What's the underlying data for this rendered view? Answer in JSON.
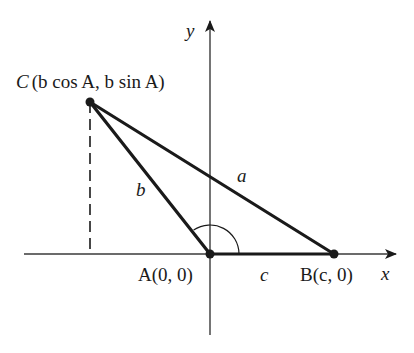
{
  "diagram": {
    "type": "triangle-coordinate-diagram",
    "colors": {
      "line": "#1a1a1a",
      "axis": "#3a3a3a",
      "background": "#ffffff"
    },
    "axes": {
      "x_label": "x",
      "y_label": "y"
    },
    "points": {
      "A": {
        "label": "A(0, 0)",
        "px": [
          210,
          254
        ]
      },
      "B": {
        "label": "B(c, 0)",
        "px": [
          334,
          254
        ]
      },
      "C": {
        "label": "C(b cos A, b sin A)",
        "px": [
          90,
          102
        ]
      }
    },
    "sides": {
      "a": "a",
      "b": "b",
      "c": "c"
    },
    "labels": {
      "C_letter": "C",
      "C_coords": "(b cos A, b sin A)",
      "A_full": "A(0, 0)",
      "B_full": "B(c, 0)"
    },
    "annotations": {
      "angle_arc_at": "A",
      "dashed_projection_from": "C"
    }
  }
}
